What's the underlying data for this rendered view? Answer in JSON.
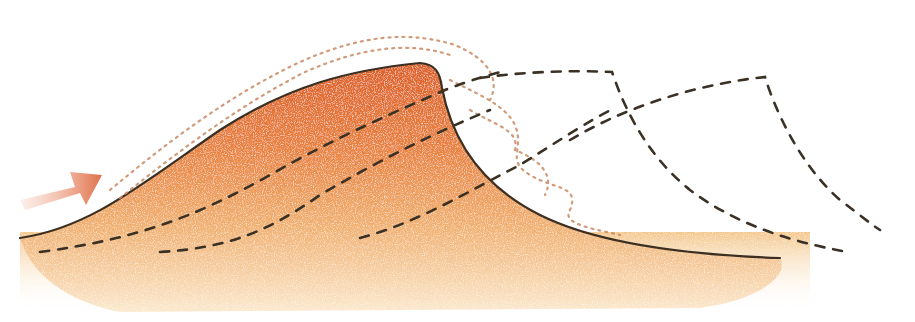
{
  "diagram": {
    "subject": "Sand dune cross-section with wind direction and dune migration",
    "elements": {
      "wind_arrow": {
        "icon": "arrow-right-up-icon",
        "meaning": "wind direction",
        "color": "#e5835f"
      },
      "dune_body": {
        "fill_top": "#e0652a",
        "fill_mid": "#eda060",
        "fill_bottom": "#f6d6a8",
        "outline": "#3b2f22"
      },
      "blowing_sand": {
        "color": "#c98a63"
      },
      "internal_layers": {
        "style": "dashed",
        "color": "#3a3024",
        "count": 3
      },
      "future_positions": {
        "style": "dashed",
        "color": "#3a3024",
        "count": 2
      }
    },
    "colors": {
      "background": "#ffffff",
      "sand_orange": "#e0652a",
      "sand_light": "#f3c68c",
      "line_dark": "#3a3024",
      "arrow": "#e5835f"
    }
  }
}
